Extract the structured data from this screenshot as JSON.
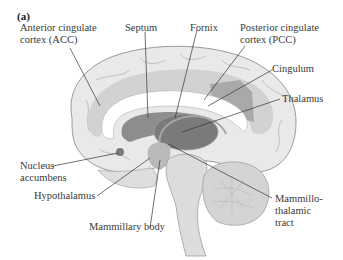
{
  "figure": {
    "panel": "(a)"
  },
  "labels": {
    "acc": {
      "line1": "Anterior cingulate",
      "line2": "cortex (ACC)"
    },
    "septum": "Septum",
    "fornix": "Fornix",
    "pcc": {
      "line1": "Posterior cingulate",
      "line2": "cortex (PCC)"
    },
    "cingulum": "Cingulum",
    "thalamus": "Thalamus",
    "nucleus_accumbens": {
      "line1": "Nucleus",
      "line2": "accumbens"
    },
    "hypothalamus": "Hypothalamus",
    "mammillary_body": "Mammillary body",
    "mammillothalamic_tract": {
      "line1": "Mammillo-",
      "line2": "thalamic",
      "line3": "tract"
    }
  },
  "colors": {
    "cortex": "#e9e9e9",
    "cortex_outline": "#9a9a9a",
    "cingulate": "#cfcfcf",
    "pcc_region": "#a9a9a9",
    "corpus_callosum": "#ffffff",
    "ventricle": "#8d8d8d",
    "thalamus": "#7a7a7a",
    "brainstem": "#dcdcdc",
    "cerebellum": "#d4d4d4",
    "leader": "#333333"
  }
}
